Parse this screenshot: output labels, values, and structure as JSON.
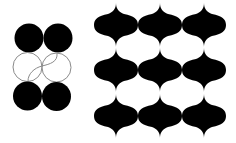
{
  "colors": {
    "fill": "#000000",
    "background": "#ffffff",
    "outline": "#8a8a8a"
  },
  "left_figure": {
    "circles": [
      {
        "cx": 29,
        "cy": 38,
        "r": 14.5,
        "style": "filled"
      },
      {
        "cx": 58,
        "cy": 38,
        "r": 14.5,
        "style": "filled"
      },
      {
        "cx": 27.5,
        "cy": 67,
        "r": 14.5,
        "style": "outlined"
      },
      {
        "cx": 56.5,
        "cy": 67.5,
        "r": 14.5,
        "style": "outlined"
      },
      {
        "cx": 27.5,
        "cy": 96,
        "r": 14.5,
        "style": "filled"
      },
      {
        "cx": 56.5,
        "cy": 96.5,
        "r": 14.5,
        "style": "filled"
      }
    ]
  },
  "right_figure": {
    "tile": "ogee",
    "columns": [
      116,
      160,
      204
    ],
    "rows": [
      25,
      70,
      116
    ],
    "half_width": 22,
    "half_height": 20
  }
}
